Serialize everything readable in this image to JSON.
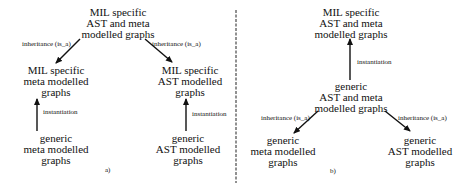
{
  "panel_a": {
    "caption": "a)",
    "top": [
      "MIL specific",
      "AST and meta",
      "modelled graphs"
    ],
    "mid_left": [
      "MIL specific",
      "meta modelled",
      "graphs"
    ],
    "mid_right": [
      "MIL specific",
      "AST modelled",
      "graphs"
    ],
    "bottom_left": [
      "generic",
      "meta modelled",
      "graphs"
    ],
    "bottom_right": [
      "generic",
      "AST modelled",
      "graphs"
    ],
    "edge_left": "inheritance (is_a)",
    "edge_right": "inheritance (is_a)",
    "inst_left": "instantiation",
    "inst_right": "instantiation"
  },
  "panel_b": {
    "caption": "b)",
    "top": [
      "MIL specific",
      "AST and meta",
      "modelled graphs"
    ],
    "mid": [
      "generic",
      "AST and meta",
      "modelled graphs"
    ],
    "bottom_left": [
      "generic",
      "meta modelled",
      "graphs"
    ],
    "bottom_right": [
      "generic",
      "AST modelled",
      "graphs"
    ],
    "inst": "instantiation",
    "edge_left": "inheritance (is_a)",
    "edge_right": "inheritance (is_a)"
  }
}
